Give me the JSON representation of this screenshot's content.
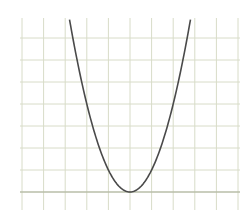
{
  "chart_data": {
    "type": "line",
    "title": "",
    "xlabel": "",
    "ylabel": "",
    "grid": true,
    "legend": null,
    "function": "y = x^2",
    "xlim": [
      -5,
      5
    ],
    "ylim": [
      0,
      8.8
    ],
    "grid_spacing": 1,
    "vertex": [
      0,
      0
    ],
    "series": [
      {
        "name": "parabola",
        "x": [
          -2.8,
          -2.5,
          -2,
          -1.5,
          -1,
          -0.5,
          0,
          0.5,
          1,
          1.5,
          2,
          2.5,
          2.8
        ],
        "y": [
          7.84,
          6.25,
          4,
          2.25,
          1,
          0.25,
          0,
          0.25,
          1,
          2.25,
          4,
          6.25,
          7.84
        ]
      }
    ]
  },
  "colors": {
    "background": "#ffffff",
    "grid": "#d8dcc8",
    "grid_axis": "#b9bea8",
    "curve": "#4a4a4a"
  }
}
